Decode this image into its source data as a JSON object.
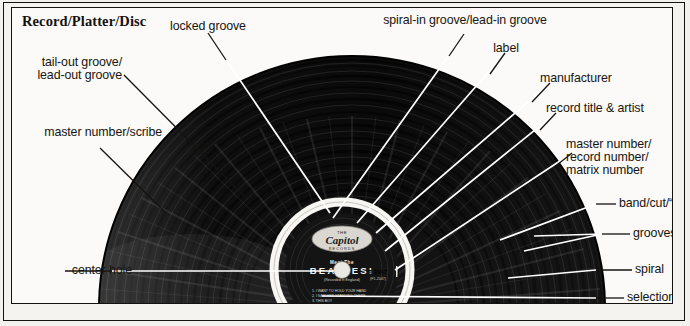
{
  "figure": {
    "title": "Record/Platter/Disc",
    "colors": {
      "ink": "#17150f",
      "paper": "#fbfaf8",
      "vinyl": "#111111",
      "leader_line": "#ffffff",
      "frame": "#15130f"
    }
  },
  "record_label": {
    "manufacturer": "Capitol",
    "manufacturer_sub": "RECORDS",
    "album_prefix": "Meet The",
    "album_title": "BEATLES!",
    "album_sub": "(Recorded in England)",
    "side_mark": "T 2047",
    "matrix": "(F1-2047)",
    "tracks": [
      "1. I WANT TO HOLD YOUR HAND",
      "2. I SAW HER STANDING THERE",
      "3. THIS BOY",
      "4. IT WON'T BE LONG",
      "5. ALL I'VE GOT TO DO",
      "6. ALL MY LOVING"
    ]
  },
  "callouts": [
    {
      "id": "locked-groove",
      "text": "locked groove"
    },
    {
      "id": "tail-out-groove",
      "text": "tail-out groove/"
    },
    {
      "id": "tail-out-groove-2",
      "text": "lead-out groove"
    },
    {
      "id": "master-number-scribe",
      "text": "master number/scribe"
    },
    {
      "id": "center-hole",
      "text": "center hole"
    },
    {
      "id": "spiral-in-groove",
      "text": "spiral-in groove/lead-in groove"
    },
    {
      "id": "label",
      "text": "label"
    },
    {
      "id": "manufacturer",
      "text": "manufacturer"
    },
    {
      "id": "record-title-artist",
      "text": "record title & artist"
    },
    {
      "id": "master-number-1",
      "text": "master number/"
    },
    {
      "id": "master-number-2",
      "text": "record number/"
    },
    {
      "id": "master-number-3",
      "text": "matrix number"
    },
    {
      "id": "band-cut-track",
      "text": "band/cut/“track”"
    },
    {
      "id": "grooves",
      "text": "grooves"
    },
    {
      "id": "spiral",
      "text": "spiral"
    },
    {
      "id": "selections",
      "text": "selections"
    }
  ]
}
